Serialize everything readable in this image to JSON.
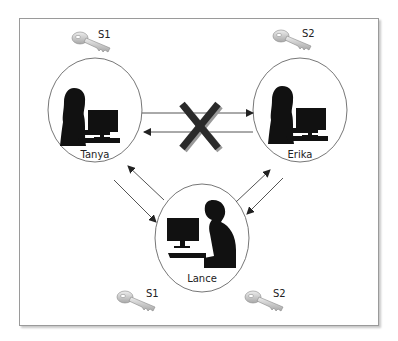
{
  "diagram": {
    "nodes": [
      {
        "id": "tanya",
        "label": "Tanya",
        "gender": "female"
      },
      {
        "id": "erika",
        "label": "Erika",
        "gender": "female"
      },
      {
        "id": "lance",
        "label": "Lance",
        "gender": "male"
      }
    ],
    "keys": [
      {
        "label": "S1",
        "near": "tanya"
      },
      {
        "label": "S2",
        "near": "erika"
      },
      {
        "label": "S1",
        "near": "lance-left"
      },
      {
        "label": "S2",
        "near": "lance-right"
      }
    ],
    "edges": [
      {
        "from": "tanya",
        "to": "erika",
        "blocked": true
      },
      {
        "from": "erika",
        "to": "tanya",
        "blocked": true
      },
      {
        "from": "tanya",
        "to": "lance"
      },
      {
        "from": "lance",
        "to": "tanya"
      },
      {
        "from": "lance",
        "to": "erika"
      },
      {
        "from": "erika",
        "to": "lance"
      }
    ],
    "blocked_marker": "X"
  }
}
